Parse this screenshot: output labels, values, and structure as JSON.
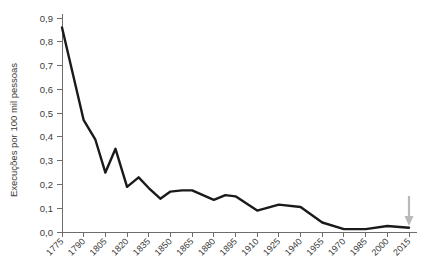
{
  "chart_data": {
    "type": "line",
    "title": "",
    "subtitle": "",
    "xlabel": "",
    "ylabel": "Execuções por 100 mil pessoas",
    "ylim": [
      0.0,
      0.9
    ],
    "xlim": [
      1775,
      2015
    ],
    "grid": false,
    "legend": null,
    "y_tick_labels": [
      "0,0",
      "0,1",
      "0,2",
      "0,3",
      "0,4",
      "0,5",
      "0,6",
      "0,7",
      "0,8",
      "0,9"
    ],
    "y_tick_values": [
      0.0,
      0.1,
      0.2,
      0.3,
      0.4,
      0.5,
      0.6,
      0.7,
      0.8,
      0.9
    ],
    "categories": [
      "1775",
      "1790",
      "1805",
      "1820",
      "1835",
      "1850",
      "1865",
      "1880",
      "1895",
      "1910",
      "1925",
      "1940",
      "1955",
      "1970",
      "1985",
      "2000",
      "2015"
    ],
    "x": [
      1775,
      1790,
      1805,
      1820,
      1835,
      1850,
      1865,
      1880,
      1895,
      1910,
      1925,
      1940,
      1955,
      1970,
      1985,
      2000,
      2015
    ],
    "values": [
      0.86,
      0.47,
      0.25,
      0.35,
      0.19,
      0.23,
      0.185,
      0.14,
      0.17,
      0.175,
      0.175,
      0.135,
      0.155,
      0.09,
      0.015,
      0.015,
      0.02
    ],
    "detailed_points": [
      {
        "x": 1775,
        "y": 0.86
      },
      {
        "x": 1790,
        "y": 0.47
      },
      {
        "x": 1798,
        "y": 0.39
      },
      {
        "x": 1805,
        "y": 0.25
      },
      {
        "x": 1812,
        "y": 0.35
      },
      {
        "x": 1820,
        "y": 0.19
      },
      {
        "x": 1828,
        "y": 0.23
      },
      {
        "x": 1835,
        "y": 0.185
      },
      {
        "x": 1843,
        "y": 0.14
      },
      {
        "x": 1850,
        "y": 0.17
      },
      {
        "x": 1858,
        "y": 0.175
      },
      {
        "x": 1865,
        "y": 0.175
      },
      {
        "x": 1880,
        "y": 0.135
      },
      {
        "x": 1888,
        "y": 0.155
      },
      {
        "x": 1895,
        "y": 0.15
      },
      {
        "x": 1910,
        "y": 0.09
      },
      {
        "x": 1925,
        "y": 0.115
      },
      {
        "x": 1940,
        "y": 0.105
      },
      {
        "x": 1955,
        "y": 0.04
      },
      {
        "x": 1970,
        "y": 0.012
      },
      {
        "x": 1985,
        "y": 0.012
      },
      {
        "x": 2000,
        "y": 0.025
      },
      {
        "x": 2015,
        "y": 0.018
      }
    ],
    "annotations": [
      {
        "name": "arrow-2015",
        "type": "arrow-down",
        "x": 2015,
        "color": "#b9b9b9"
      }
    ],
    "colors": {
      "line": "#1a1a1a",
      "axis": "#6d6d6d",
      "text": "#3a3a3a",
      "annotation": "#b9b9b9",
      "background": "#ffffff"
    }
  }
}
